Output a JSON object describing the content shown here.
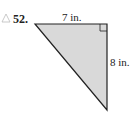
{
  "problem": {
    "number": "52.",
    "icon": "triangle-icon"
  },
  "figure": {
    "type": "right-triangle",
    "top_side_label": "7 in.",
    "right_side_label": "8 in.",
    "fill_color": "#d9d9d9",
    "stroke_color": "#222222"
  }
}
